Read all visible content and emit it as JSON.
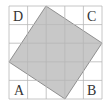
{
  "diagram": {
    "grid": {
      "rows": 5,
      "cols": 5,
      "line_color": "#b8b8b8",
      "background": "#ffffff"
    },
    "shaded_square": {
      "fill": "#c8c8c8",
      "stroke": "#666666"
    },
    "labels": {
      "top_left": "D",
      "top_right": "C",
      "bottom_left": "A",
      "bottom_right": "B"
    }
  }
}
